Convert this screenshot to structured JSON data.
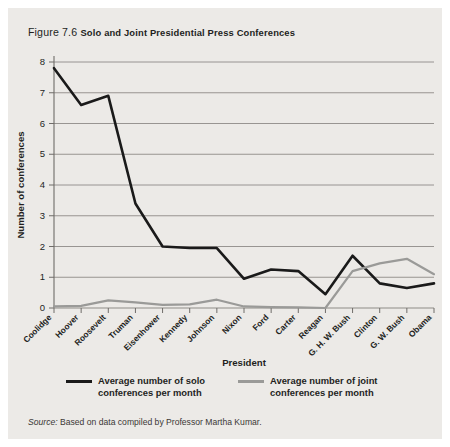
{
  "figure": {
    "number_label": "Figure 7.6",
    "title": "Solo and Joint Presidential Press Conferences",
    "source_label": "Source:",
    "source_text": " Based on data compiled by Professor Martha Kumar."
  },
  "legend": {
    "items": [
      {
        "key": "solo",
        "label": "Average number of solo conferences per month",
        "color": "#1a1a1a"
      },
      {
        "key": "joint",
        "label": "Average number of joint conferences per month",
        "color": "#9a9a98"
      }
    ]
  },
  "colors": {
    "panel_background": "#eceae7",
    "page_background": "#ffffff",
    "gridline": "#8e8b88",
    "axis": "#6f6c69",
    "text": "#231f1d",
    "solo_line": "#1a1a1a",
    "joint_line": "#9a9a98"
  },
  "chart_data": {
    "type": "line",
    "title": "Solo and Joint Presidential Press Conferences",
    "xlabel": "President",
    "ylabel": "Number of conferences",
    "ylim": [
      0,
      8
    ],
    "yticks": [
      0,
      1,
      2,
      3,
      4,
      5,
      6,
      7,
      8
    ],
    "ytick_labels": [
      "0",
      "1",
      "2",
      "3",
      "4",
      "5",
      "6",
      "7",
      "8"
    ],
    "grid": true,
    "legend_position": "bottom",
    "categories": [
      "Coolidge",
      "Hoover",
      "Roosevelt",
      "Truman",
      "Eisenhower",
      "Kennedy",
      "Johnson",
      "Nixon",
      "Ford",
      "Carter",
      "Reagan",
      "G. H. W. Bush",
      "Clinton",
      "G. W. Bush",
      "Obama"
    ],
    "series": [
      {
        "name": "Average number of solo conferences per month",
        "color": "#1a1a1a",
        "values": [
          7.8,
          6.6,
          6.9,
          3.4,
          2.0,
          1.95,
          1.95,
          0.95,
          1.25,
          1.2,
          0.45,
          1.7,
          0.8,
          0.65,
          0.8
        ]
      },
      {
        "name": "Average number of joint conferences per month",
        "color": "#9a9a98",
        "values": [
          0.05,
          0.07,
          0.25,
          0.18,
          0.1,
          0.12,
          0.27,
          0.05,
          0.03,
          0.02,
          0.0,
          1.2,
          1.45,
          1.6,
          1.1
        ]
      }
    ]
  }
}
